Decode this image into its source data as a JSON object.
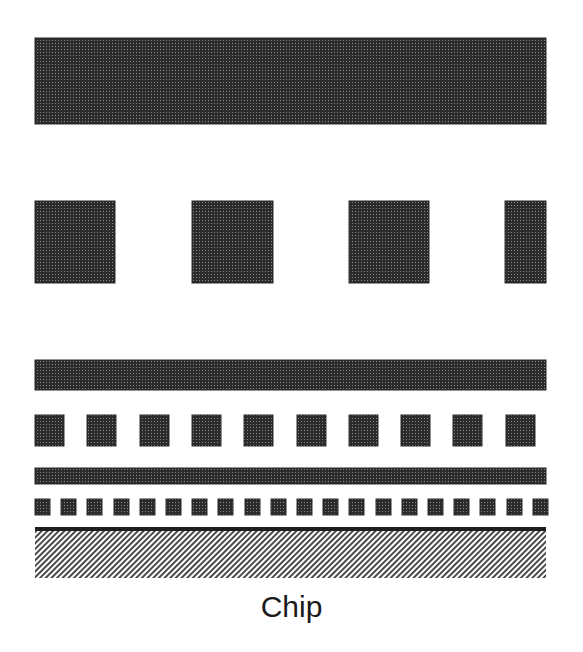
{
  "diagram": {
    "title": "Chip",
    "colors": {
      "metal_fill": "#2b2b2b",
      "metal_dot": "#8a8a8a",
      "substrate_line": "#4a4a4a",
      "chip_top_line": "#1e1e1e",
      "background": "#ffffff"
    },
    "layers": [
      {
        "name": "wide-top-bar",
        "type": "bar",
        "x": 35,
        "y": 38,
        "w": 511,
        "h": 86
      },
      {
        "name": "large-pads",
        "type": "squares",
        "y": 201,
        "h": 82,
        "items": [
          {
            "x": 35,
            "w": 80
          },
          {
            "x": 192,
            "w": 81
          },
          {
            "x": 349,
            "w": 80
          },
          {
            "x": 505,
            "w": 41
          }
        ]
      },
      {
        "name": "middle-bar",
        "type": "bar",
        "x": 35,
        "y": 360,
        "w": 511,
        "h": 30
      },
      {
        "name": "medium-pads",
        "type": "repeat",
        "x0": 35,
        "y": 415,
        "size": 29,
        "h": 31,
        "pitch": 52.3,
        "count": 10
      },
      {
        "name": "thin-bar",
        "type": "bar",
        "x": 35,
        "y": 468,
        "w": 511,
        "h": 16
      },
      {
        "name": "small-pads",
        "type": "repeat",
        "x0": 35,
        "y": 499,
        "size": 15,
        "h": 16,
        "pitch": 26.2,
        "count": 20
      },
      {
        "name": "chip-surface-line",
        "type": "line",
        "x": 35,
        "y": 527,
        "w": 511,
        "h": 4
      },
      {
        "name": "chip-substrate",
        "type": "hatch",
        "x": 35,
        "y": 531,
        "w": 511,
        "h": 47
      }
    ]
  }
}
